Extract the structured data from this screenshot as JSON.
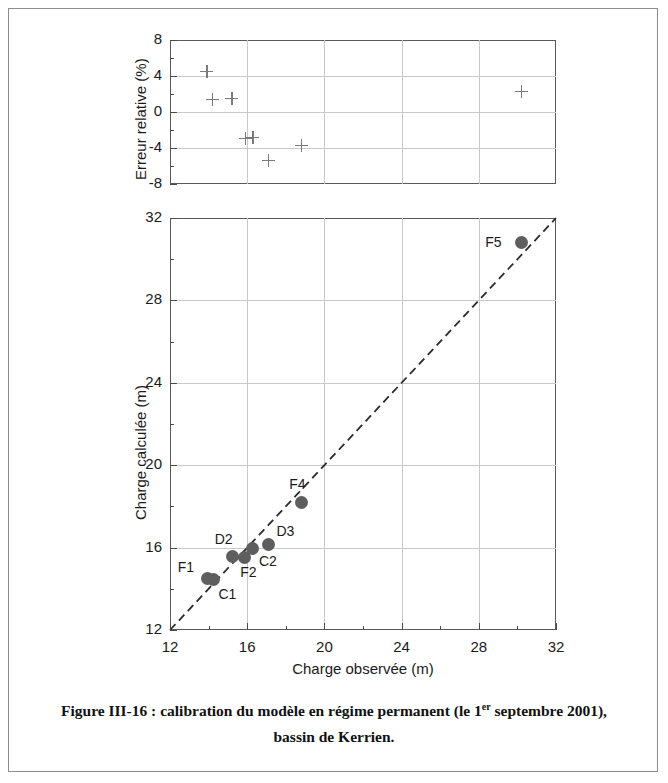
{
  "figure": {
    "caption_prefix": "Figure III-16 : calibration du modèle en régime permanent (le 1",
    "caption_sup": "er",
    "caption_mid": " septembre 2001),",
    "caption_line2": "bassin de Kerrien."
  },
  "error_chart": {
    "type": "scatter",
    "ylabel": "Erreur relative (%)",
    "xlabel": "",
    "ylim": [
      -8,
      8
    ],
    "xlim": [
      12,
      32
    ],
    "yticks": [
      8,
      4,
      0,
      -4,
      -8
    ],
    "ytick_labels": [
      "8",
      "4",
      "0",
      "-4",
      "-8"
    ],
    "yminor": [
      6,
      2,
      -2,
      -6
    ],
    "xgrid": [
      16,
      20,
      24,
      28
    ],
    "ygrid": [
      4,
      0,
      -4
    ],
    "grid": true,
    "marker": "plus",
    "marker_color": "#7a7a7a",
    "points": [
      {
        "name": "F1",
        "x": 13.9,
        "y": 4.5
      },
      {
        "name": "C1",
        "x": 14.2,
        "y": 1.4
      },
      {
        "name": "D2",
        "x": 15.2,
        "y": 1.5
      },
      {
        "name": "F2",
        "x": 15.9,
        "y": -2.9
      },
      {
        "name": "C2",
        "x": 16.3,
        "y": -2.8
      },
      {
        "name": "D3",
        "x": 17.1,
        "y": -5.4
      },
      {
        "name": "F4",
        "x": 18.8,
        "y": -3.7
      },
      {
        "name": "F5",
        "x": 30.2,
        "y": 2.3
      }
    ]
  },
  "calibration_chart": {
    "type": "scatter",
    "xlabel": "Charge observée (m)",
    "ylabel": "Charge calculée (m)",
    "xlim": [
      12,
      32
    ],
    "ylim": [
      12,
      32
    ],
    "xticks": [
      12,
      16,
      20,
      24,
      28,
      32
    ],
    "xtick_labels": [
      "12",
      "16",
      "20",
      "24",
      "28",
      "32"
    ],
    "yticks": [
      12,
      16,
      20,
      24,
      28,
      32
    ],
    "ytick_labels": [
      "12",
      "16",
      "20",
      "24",
      "28",
      "32"
    ],
    "xminor": [
      14,
      18,
      22,
      26,
      30
    ],
    "yminor": [
      14,
      18,
      22,
      26,
      30
    ],
    "xgrid": [
      16,
      20,
      24,
      28
    ],
    "ygrid": [
      16,
      20,
      24,
      28
    ],
    "grid": true,
    "marker": "circle",
    "marker_color": "#5e5e5e",
    "reference_line": {
      "style": "dashed",
      "color": "#2b2b2b",
      "from": [
        12,
        12
      ],
      "to": [
        32,
        32
      ]
    },
    "points": [
      {
        "name": "F1",
        "x": 13.95,
        "y": 14.5,
        "label_dx": -30,
        "label_dy": -20
      },
      {
        "name": "C1",
        "x": 14.25,
        "y": 14.45,
        "label_dx": 5,
        "label_dy": 6
      },
      {
        "name": "D2",
        "x": 15.25,
        "y": 15.55,
        "label_dx": -18,
        "label_dy": -26
      },
      {
        "name": "F2",
        "x": 15.85,
        "y": 15.5,
        "label_dx": -4,
        "label_dy": 6
      },
      {
        "name": "C2",
        "x": 16.3,
        "y": 15.95,
        "label_dx": 6,
        "label_dy": 4
      },
      {
        "name": "D3",
        "x": 17.1,
        "y": 16.15,
        "label_dx": 8,
        "label_dy": -22
      },
      {
        "name": "F4",
        "x": 18.8,
        "y": 18.2,
        "label_dx": -12,
        "label_dy": -26
      },
      {
        "name": "F5",
        "x": 30.2,
        "y": 30.8,
        "label_dx": -36,
        "label_dy": -9
      }
    ]
  }
}
